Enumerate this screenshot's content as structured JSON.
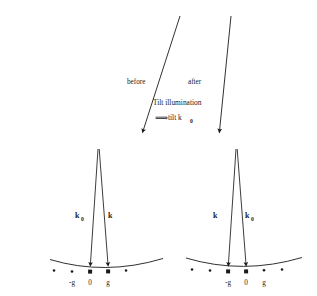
{
  "figure": {
    "background_color": "#ffffff",
    "ink_color": "#1a1a1a",
    "width": 317,
    "height": 296
  },
  "top_section": {
    "before_label": "before",
    "after_label": "after",
    "caption_line1": "Tilt illumination",
    "caption_line2_glyph": "⟹",
    "caption_line2_text": "tilt k",
    "caption_line2_subscript": "0",
    "arrows": [
      {
        "name": "before-arrow",
        "x1": 180,
        "y1": 16,
        "x2": 143,
        "y2": 133
      },
      {
        "name": "after-arrow",
        "x1": 231,
        "y1": 16,
        "x2": 219,
        "y2": 133
      }
    ]
  },
  "panels": [
    {
      "id": "left-panel",
      "name": "before-panel",
      "apex": {
        "x": 98,
        "y": 149
      },
      "vector_labels": [
        {
          "symbol": "k",
          "subscript": "0",
          "x": 79,
          "y": 218
        },
        {
          "symbol": "k",
          "subscript": "",
          "x": 111,
          "y": 218
        }
      ],
      "vectors": [
        {
          "name": "k0-vector",
          "x1": 98,
          "y1": 149,
          "x2": 90,
          "y2": 267
        },
        {
          "name": "k-vector",
          "x1": 99,
          "y1": 149,
          "x2": 108,
          "y2": 267
        }
      ],
      "ewald_arc": {
        "x_start": 50,
        "y_start": 260,
        "x_mid": 105,
        "y_mid": 273,
        "x_end": 163,
        "y_end": 259
      },
      "lattice_dots": [
        {
          "label": "",
          "x": 54,
          "y": 271,
          "highlight": false
        },
        {
          "label": "-g",
          "x": 72,
          "y": 272,
          "highlight": false
        },
        {
          "label": "0",
          "x": 90,
          "y": 272,
          "highlight": true
        },
        {
          "label": "g",
          "x": 108,
          "y": 272,
          "highlight": true
        },
        {
          "label": "",
          "x": 126,
          "y": 271,
          "highlight": false
        }
      ],
      "axis_labels": [
        {
          "text": "-g",
          "x": 72,
          "y": 284
        },
        {
          "text": "0",
          "x": 90,
          "y": 284
        },
        {
          "text": "g",
          "x": 108,
          "y": 284
        }
      ]
    },
    {
      "id": "right-panel",
      "name": "after-panel",
      "apex": {
        "x": 236,
        "y": 149
      },
      "vector_labels": [
        {
          "symbol": "k",
          "subscript": "",
          "x": 217,
          "y": 218
        },
        {
          "symbol": "k",
          "subscript": "0",
          "x": 248,
          "y": 218
        }
      ],
      "vectors": [
        {
          "name": "k-vector",
          "x1": 236,
          "y1": 149,
          "x2": 228,
          "y2": 267
        },
        {
          "name": "k0-vector",
          "x1": 237,
          "y1": 149,
          "x2": 246,
          "y2": 267
        }
      ],
      "ewald_arc": {
        "x_start": 186,
        "y_start": 258,
        "x_mid": 243,
        "y_mid": 272,
        "x_end": 302,
        "y_end": 258
      },
      "lattice_dots": [
        {
          "label": "",
          "x": 192,
          "y": 270,
          "highlight": false
        },
        {
          "label": "",
          "x": 210,
          "y": 271,
          "highlight": false
        },
        {
          "label": "-g",
          "x": 228,
          "y": 272,
          "highlight": true
        },
        {
          "label": "0",
          "x": 246,
          "y": 272,
          "highlight": true
        },
        {
          "label": "g",
          "x": 264,
          "y": 271,
          "highlight": false
        },
        {
          "label": "",
          "x": 282,
          "y": 270,
          "highlight": false
        }
      ],
      "axis_labels": [
        {
          "text": "-g",
          "x": 228,
          "y": 284
        },
        {
          "text": "0",
          "x": 246,
          "y": 284
        },
        {
          "text": "g",
          "x": 264,
          "y": 284
        }
      ]
    }
  ]
}
